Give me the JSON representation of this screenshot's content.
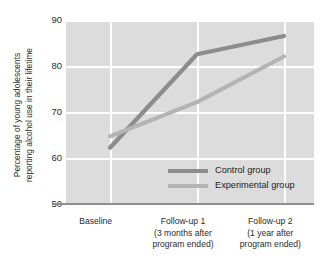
{
  "chart_data": {
    "type": "line",
    "title": "",
    "xlabel": "",
    "ylabel": "Percentage of young adolescents reporting alcohol use in their lifetime",
    "ylabel_line1": "Percentage of young adolescents",
    "ylabel_line2": "reporting alcohol use in their lifetime",
    "categories": [
      "Baseline",
      "Follow-up 1",
      "Follow-up 2"
    ],
    "category_sublabels": [
      [
        "Baseline"
      ],
      [
        "Follow-up 1",
        "(3 months after",
        "program ended)"
      ],
      [
        "Follow-up 2",
        "(1 year after",
        "program ended)"
      ]
    ],
    "series": [
      {
        "name": "Control group",
        "values": [
          62,
          82.5,
          86.5
        ],
        "color": "#8c8c8c"
      },
      {
        "name": "Experimental group",
        "values": [
          64.5,
          72,
          82
        ],
        "color": "#b4b4b4"
      }
    ],
    "yticks": [
      90,
      80,
      70,
      60,
      50
    ],
    "ylim": [
      50,
      90
    ],
    "grid": true,
    "legend_position": "inside-bottom-right",
    "plot_background": "#dcdcdc",
    "gridline_color": "#ffffff"
  },
  "legend": {
    "items": [
      {
        "label": "Control group",
        "color": "#8c8c8c"
      },
      {
        "label": "Experimental group",
        "color": "#b4b4b4"
      }
    ]
  },
  "yaxis": {
    "ticks": [
      {
        "value": "90"
      },
      {
        "value": "80"
      },
      {
        "value": "70"
      },
      {
        "value": "60"
      },
      {
        "value": "50"
      }
    ]
  },
  "xaxis": {
    "groups": [
      {
        "line1": "Baseline",
        "line2": "",
        "line3": ""
      },
      {
        "line1": "Follow-up 1",
        "line2": "(3 months after",
        "line3": "program ended)"
      },
      {
        "line1": "Follow-up 2",
        "line2": "(1 year after",
        "line3": "program ended)"
      }
    ]
  }
}
